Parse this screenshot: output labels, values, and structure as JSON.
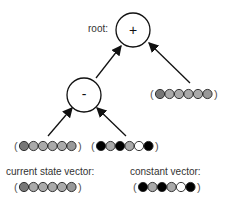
{
  "tree": {
    "root": {
      "label": "root:",
      "operator": "+"
    },
    "inner_node": {
      "operator": "-"
    },
    "right_leaf": {
      "cells": [
        "#777777",
        "#aaaaaa",
        "#aaaaaa",
        "#aaaaaa",
        "#aaaaaa",
        "#999999"
      ]
    },
    "left_leaf": {
      "cells": [
        "#777777",
        "#aaaaaa",
        "#aaaaaa",
        "#aaaaaa",
        "#aaaaaa",
        "#999999"
      ]
    },
    "middle_leaf": {
      "cells": [
        "#000000",
        "#aaaaaa",
        "#000000",
        "#aaaaaa",
        "#ffffff",
        "#000000"
      ]
    }
  },
  "legend": {
    "current_state": {
      "label": "current state vector:",
      "cells": [
        "#777777",
        "#aaaaaa",
        "#aaaaaa",
        "#aaaaaa",
        "#aaaaaa",
        "#999999"
      ]
    },
    "constant": {
      "label": "constant vector:",
      "cells": [
        "#000000",
        "#aaaaaa",
        "#000000",
        "#aaaaaa",
        "#ffffff",
        "#000000"
      ]
    }
  },
  "colors": {
    "stroke": "#111111",
    "paren": "#555555"
  }
}
